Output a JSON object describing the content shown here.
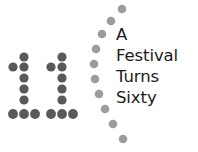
{
  "logo": {
    "alt_name": "11 A Festival Turns Sixty",
    "background_color": "#ffffff",
    "numeral_text": "11",
    "numeral_dot_color": "#595959",
    "arc_dot_color": "#9c9c9c",
    "text_color": "#1b1b1b",
    "lines": [
      {
        "text": "A"
      },
      {
        "text": "Festival"
      },
      {
        "text": "Turns"
      },
      {
        "text": "Sixty"
      }
    ],
    "numeral_dots": [
      {
        "x": 24,
        "y": 57,
        "r": 4.6
      },
      {
        "x": 13,
        "y": 67,
        "r": 4.6
      },
      {
        "x": 24,
        "y": 67,
        "r": 4.6
      },
      {
        "x": 24,
        "y": 78,
        "r": 4.6
      },
      {
        "x": 24,
        "y": 89,
        "r": 4.6
      },
      {
        "x": 24,
        "y": 100,
        "r": 4.6
      },
      {
        "x": 62,
        "y": 57,
        "r": 4.6
      },
      {
        "x": 51,
        "y": 67,
        "r": 4.6
      },
      {
        "x": 62,
        "y": 67,
        "r": 4.6
      },
      {
        "x": 62,
        "y": 78,
        "r": 4.6
      },
      {
        "x": 62,
        "y": 89,
        "r": 4.6
      },
      {
        "x": 62,
        "y": 100,
        "r": 4.6
      },
      {
        "x": 13,
        "y": 114,
        "r": 4.9
      },
      {
        "x": 24,
        "y": 114,
        "r": 4.9
      },
      {
        "x": 35,
        "y": 114,
        "r": 4.9
      },
      {
        "x": 51,
        "y": 114,
        "r": 4.9
      },
      {
        "x": 62,
        "y": 114,
        "r": 4.9
      },
      {
        "x": 73,
        "y": 114,
        "r": 4.9
      }
    ],
    "arc_dots": [
      {
        "x": 122,
        "y": 9,
        "r": 4.3
      },
      {
        "x": 111,
        "y": 21,
        "r": 4.3
      },
      {
        "x": 102,
        "y": 34,
        "r": 4.3
      },
      {
        "x": 96,
        "y": 49,
        "r": 4.3
      },
      {
        "x": 94,
        "y": 64,
        "r": 4.3
      },
      {
        "x": 95,
        "y": 79,
        "r": 4.3
      },
      {
        "x": 99,
        "y": 94,
        "r": 4.3
      },
      {
        "x": 105,
        "y": 109,
        "r": 4.3
      },
      {
        "x": 113,
        "y": 124,
        "r": 4.3
      },
      {
        "x": 123,
        "y": 139,
        "r": 4.3
      }
    ]
  }
}
